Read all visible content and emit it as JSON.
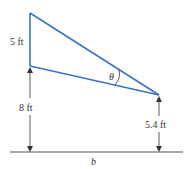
{
  "diagram": {
    "labels": {
      "top_segment": "5 ft",
      "left_height": "8 ft",
      "right_height": "5.4 ft",
      "angle": "θ",
      "base": "b"
    },
    "colors": {
      "triangle": "#3a72c4",
      "dimension": "#333333",
      "ground": "#555555"
    }
  }
}
